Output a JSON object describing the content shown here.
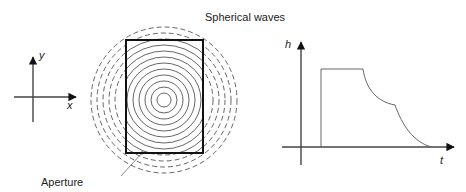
{
  "diagram": {
    "left_axes": {
      "x_label": "x",
      "y_label": "y"
    },
    "wavefront": {
      "title": "Spherical waves",
      "aperture_label": "Aperture",
      "solid_ring_radii": [
        7,
        13,
        19,
        25,
        31,
        37,
        43,
        49,
        55,
        61
      ],
      "dashed_ring_radii": [
        49,
        55,
        61,
        67,
        73
      ],
      "line_color": "#444444"
    },
    "impulse_response": {
      "x_label": "t",
      "y_label": "h",
      "line_color": "#666666",
      "shape": "rectangular pulse with flat top, then two concave decay segments to zero"
    }
  }
}
